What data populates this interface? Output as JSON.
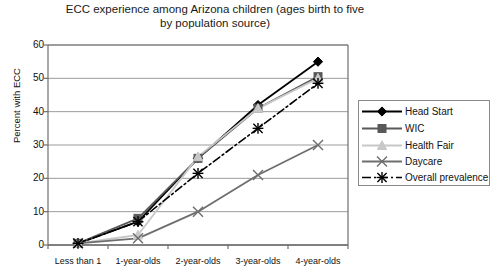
{
  "chart_data": {
    "type": "line",
    "title": "ECC experience among Arizona children (ages birth to five by population source)",
    "xlabel": "",
    "ylabel": "Percent with ECC",
    "categories": [
      "Less than 1",
      "1-year-olds",
      "2-year-olds",
      "3-year-olds",
      "4-year-olds"
    ],
    "ylim": [
      0,
      60
    ],
    "yticks": [
      0,
      10,
      20,
      30,
      40,
      50,
      60
    ],
    "grid": true,
    "legend_position": "right",
    "series": [
      {
        "name": "Head Start",
        "values": [
          0.5,
          7,
          26,
          42,
          55
        ],
        "color": "#000000",
        "marker": "diamond",
        "dash": false
      },
      {
        "name": "WIC",
        "values": [
          0.5,
          8,
          26,
          41,
          50.5
        ],
        "color": "#595959",
        "marker": "square",
        "dash": false
      },
      {
        "name": "Health Fair",
        "values": [
          0.5,
          3,
          26.5,
          41,
          50
        ],
        "color": "#c8c8c8",
        "marker": "triangle",
        "dash": false
      },
      {
        "name": "Daycare",
        "values": [
          0.5,
          2,
          10,
          21,
          30
        ],
        "color": "#6e6e6e",
        "marker": "x",
        "dash": false
      },
      {
        "name": "Overall prevalence",
        "values": [
          0.5,
          7,
          21.5,
          35,
          48.5
        ],
        "color": "#000000",
        "marker": "asterisk",
        "dash": true
      }
    ]
  },
  "legend": {
    "items": [
      {
        "label": "Head Start"
      },
      {
        "label": "WIC"
      },
      {
        "label": "Health Fair"
      },
      {
        "label": "Daycare"
      },
      {
        "label": "Overall prevalence"
      }
    ]
  },
  "axis": {
    "y_tick_labels": [
      "60",
      "50",
      "40",
      "30",
      "20",
      "10",
      "0"
    ]
  }
}
